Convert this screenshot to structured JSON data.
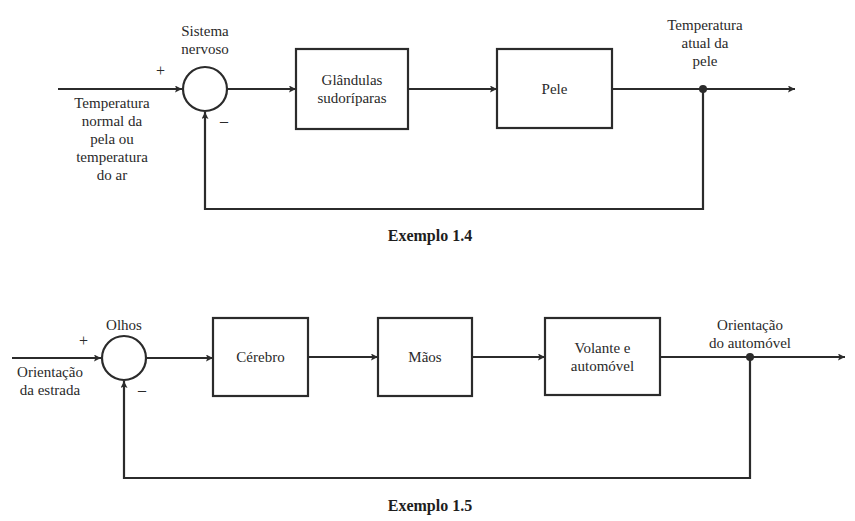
{
  "diagrams": [
    {
      "caption": "Exemplo 1.4",
      "summing_junction": {
        "label_line1": "Sistema",
        "label_line2": "nervoso",
        "plus": "+",
        "minus": "–"
      },
      "input": {
        "lines": [
          "Temperatura",
          "normal da",
          "pela ou",
          "temperatura",
          "do ar"
        ]
      },
      "blocks": [
        {
          "line1": "Glândulas",
          "line2": "sudoríparas"
        },
        {
          "line1": "Pele",
          "line2": ""
        }
      ],
      "output": {
        "lines": [
          "Temperatura",
          "atual da",
          "pele"
        ]
      }
    },
    {
      "caption": "Exemplo 1.5",
      "summing_junction": {
        "label_line1": "Olhos",
        "plus": "+",
        "minus": "–"
      },
      "input": {
        "lines": [
          "Orientação",
          "da estrada"
        ]
      },
      "blocks": [
        {
          "line1": "Cérebro",
          "line2": ""
        },
        {
          "line1": "Mãos",
          "line2": ""
        },
        {
          "line1": "Volante e",
          "line2": "automóvel"
        }
      ],
      "output": {
        "lines": [
          "Orientação",
          "do automóvel"
        ]
      }
    }
  ],
  "colors": {
    "line": "#2b2b2b",
    "background": "#ffffff"
  }
}
